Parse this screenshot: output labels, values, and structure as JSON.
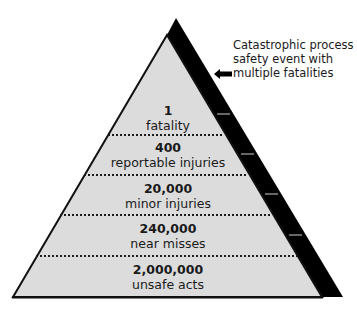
{
  "diagram": {
    "type": "safety-pyramid",
    "colors": {
      "fill": "#dcdcdc",
      "strip": "#000000",
      "outline": "#111111",
      "dots": "#1a1a1a",
      "ticks": "#8a8a8a"
    },
    "tiers": [
      {
        "count": "1",
        "label": "fatality"
      },
      {
        "count": "400",
        "label": "reportable injuries"
      },
      {
        "count": "20,000",
        "label": "minor injuries"
      },
      {
        "count": "240,000",
        "label": "near misses"
      },
      {
        "count": "2,000,000",
        "label": "unsafe acts"
      }
    ],
    "callout": {
      "lines": [
        "Catastrophic process",
        "safety event with",
        "multiple fatalities"
      ],
      "icon": "arrow-left-icon"
    }
  }
}
